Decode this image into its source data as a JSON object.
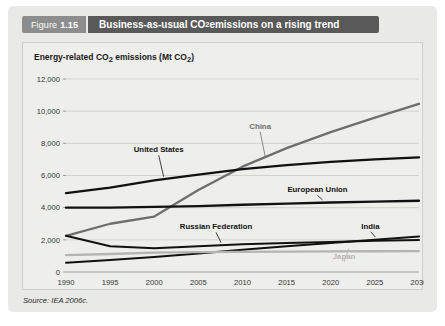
{
  "figure": {
    "number_prefix": "Figure",
    "number": "1.15",
    "title_part1": "Business-as-usual CO",
    "title_sub": "2",
    "title_part2": " emissions on a rising trend"
  },
  "axis_title": {
    "part1": "Energy-related CO",
    "sub1": "2",
    "part2": " emissions (Mt CO",
    "sub2": "2",
    "part3": ")"
  },
  "source": "Source: IEA 2006c.",
  "colors": {
    "panel_background": "#e9e9e7",
    "card_background": "#eeeeec",
    "tag_grey": "#8d8d8d",
    "title_bar_grey": "#595959",
    "series_dark": "#111111",
    "series_mid": "#6e6e6e",
    "series_light": "#b4b4b0",
    "gridline": "#d2d2cd",
    "axis": "#9a9a95"
  },
  "chart_data": {
    "type": "line",
    "title": "Business-as-usual CO2 emissions on a rising trend",
    "xlabel": "",
    "ylabel": "Energy-related CO2 emissions (Mt CO2)",
    "xlim": [
      1990,
      2030
    ],
    "ylim": [
      0,
      12000
    ],
    "grid": true,
    "legend": "inline-labels",
    "x": [
      1990,
      1995,
      2000,
      2005,
      2010,
      2015,
      2020,
      2025,
      2030
    ],
    "ytick_labels": [
      "0",
      "2,000",
      "4,000",
      "6,000",
      "8,000",
      "10,000",
      "12,000"
    ],
    "ytick_values": [
      0,
      2000,
      4000,
      6000,
      8000,
      10000,
      12000
    ],
    "xtick_labels": [
      "1990",
      "1995",
      "2000",
      "2005",
      "2010",
      "2015",
      "2020",
      "2025",
      "2030"
    ],
    "series": [
      {
        "name": "China",
        "color": "#6e6e6e",
        "width": 2.3,
        "label_x": 2012,
        "label_y": 8900,
        "values": [
          2250,
          3000,
          3450,
          5100,
          6550,
          7700,
          8700,
          9600,
          10450
        ]
      },
      {
        "name": "United States",
        "color": "#111111",
        "width": 2.3,
        "label_x": 2000.5,
        "label_y": 7450,
        "values": [
          4900,
          5250,
          5700,
          6050,
          6400,
          6650,
          6850,
          7000,
          7130
        ]
      },
      {
        "name": "European Union",
        "color": "#111111",
        "width": 2.3,
        "label_x": 2018.5,
        "label_y": 4950,
        "values": [
          4000,
          4000,
          4050,
          4100,
          4180,
          4250,
          4320,
          4380,
          4430
        ]
      },
      {
        "name": "India",
        "color": "#111111",
        "width": 2.0,
        "label_x": 2024.5,
        "label_y": 2700,
        "values": [
          580,
          750,
          930,
          1150,
          1380,
          1600,
          1800,
          2000,
          2200
        ]
      },
      {
        "name": "Russian Federation",
        "color": "#111111",
        "width": 2.0,
        "label_x": 2007,
        "label_y": 2650,
        "values": [
          2250,
          1600,
          1480,
          1600,
          1720,
          1800,
          1870,
          1940,
          1990
        ]
      },
      {
        "name": "Japan",
        "color": "#b4b4b0",
        "width": 2.3,
        "label_x": 2021.5,
        "label_y": 800,
        "values": [
          1050,
          1120,
          1200,
          1230,
          1250,
          1270,
          1280,
          1290,
          1300
        ]
      }
    ]
  }
}
